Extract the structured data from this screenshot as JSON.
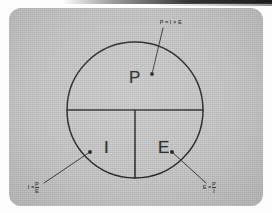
{
  "scene": {
    "medium": "scanned-photograph",
    "subject": "hand-drawn power wheel diagram",
    "card_color": "#c3c3c3",
    "ink_color": "#262626",
    "page_color": "#fdfdfd"
  },
  "diagram": {
    "type": "pie-wheel",
    "title_formula": "P = I × E",
    "circle": {
      "cx": 135,
      "cy": 110,
      "r": 68
    },
    "segments": [
      {
        "id": "power",
        "label": "P",
        "position": "top-half",
        "label_x": 129,
        "label_y": 78
      },
      {
        "id": "current",
        "label": "I",
        "position": "bottom-left",
        "label_x": 103,
        "label_y": 148
      },
      {
        "id": "voltage",
        "label": "E",
        "position": "bottom-right",
        "label_x": 157,
        "label_y": 148
      }
    ],
    "annotations": [
      {
        "id": "power-formula",
        "text": "P = I × E",
        "style": "inline",
        "text_x": 160,
        "text_y": 22,
        "leader": {
          "x1": 163,
          "y1": 28,
          "x2": 152,
          "y2": 74
        },
        "dot": {
          "x": 152,
          "y": 74
        }
      },
      {
        "id": "current-formula",
        "lhs": "I =",
        "numerator": "P",
        "denominator": "E",
        "style": "fraction",
        "text_x": 28,
        "text_y": 186,
        "leader": {
          "x1": 44,
          "y1": 183,
          "x2": 90,
          "y2": 152
        },
        "dot": {
          "x": 90,
          "y": 152
        }
      },
      {
        "id": "voltage-formula",
        "lhs": "E =",
        "numerator": "P",
        "denominator": "I",
        "style": "fraction",
        "text_x": 203,
        "text_y": 186,
        "leader": {
          "x1": 206,
          "y1": 183,
          "x2": 172,
          "y2": 152
        },
        "dot": {
          "x": 172,
          "y": 152
        }
      }
    ],
    "dividers": [
      {
        "id": "horizontal-chord",
        "x1": 67,
        "y1": 110,
        "x2": 203,
        "y2": 110
      },
      {
        "id": "vertical-split",
        "x1": 135,
        "y1": 110,
        "x2": 135,
        "y2": 178
      }
    ]
  }
}
